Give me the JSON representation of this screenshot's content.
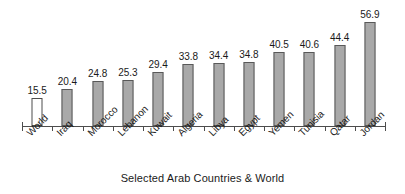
{
  "chart_data": {
    "type": "bar",
    "title": "",
    "xlabel": "Selected Arab Countries & World",
    "ylabel": "",
    "ylim": [
      0,
      60
    ],
    "grid": false,
    "legend": "none",
    "categories": [
      "World",
      "Iraq",
      "Morocco",
      "Lebanon",
      "Kuwait",
      "Algeria",
      "Libya",
      "Egypt",
      "Yemen",
      "Tunisia",
      "Qatar",
      "Jordan"
    ],
    "values": [
      15.5,
      20.4,
      24.8,
      25.3,
      29.4,
      33.8,
      34.4,
      34.8,
      40.5,
      40.6,
      44.4,
      56.9
    ],
    "value_labels": [
      "15.5",
      "20.4",
      "24.8",
      "25.3",
      "29.4",
      "33.8",
      "34.4",
      "34.8",
      "40.5",
      "40.6",
      "44.4",
      "56.9"
    ],
    "bar_styles": [
      "hollow",
      "filled",
      "filled",
      "filled",
      "filled",
      "filled",
      "filled",
      "filled",
      "filled",
      "filled",
      "filled",
      "filled"
    ],
    "colors": {
      "bar_fill": "#a9a9a9",
      "bar_stroke": "#595959",
      "hollow_fill": "#ffffff",
      "hollow_stroke": "#4d4d4d",
      "axis": "#4d4d4d",
      "text": "#1a1a1a",
      "background": "#ffffff"
    }
  }
}
